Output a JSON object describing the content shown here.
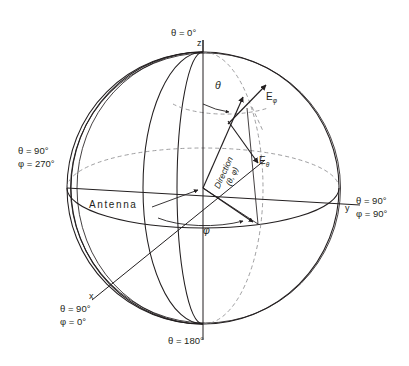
{
  "figure": {
    "type": "spherical-coordinate-diagram",
    "origin_label": "Antenna",
    "background_color": "#ffffff",
    "line_color": "#231f20",
    "hidden_line_color": "#8e8e90"
  },
  "axes": {
    "z": {
      "letter": "z",
      "pole_top_label": "θ = 0°",
      "pole_bottom_label": "θ = 180°"
    },
    "y": {
      "letter": "y",
      "theta": "θ = 90°",
      "phi": "φ = 90°"
    },
    "x": {
      "letter": "x",
      "theta": "θ = 90°",
      "phi": "φ = 0°"
    },
    "minus_y": {
      "theta": "θ = 90°",
      "phi": "φ = 270°"
    }
  },
  "annotations": {
    "direction_line1": "Direction",
    "direction_line2": "(θ, φ)",
    "theta_angle": "θ",
    "phi_angle": "φ",
    "e_phi": "E",
    "e_phi_sub": "φ",
    "e_theta": "E",
    "e_theta_sub": "θ",
    "antenna": "Antenna"
  },
  "geometry": {
    "center_x": 203,
    "center_y": 188,
    "radius": 136,
    "equator_minor_axis": 40,
    "meridian_minor_axis": 52
  }
}
